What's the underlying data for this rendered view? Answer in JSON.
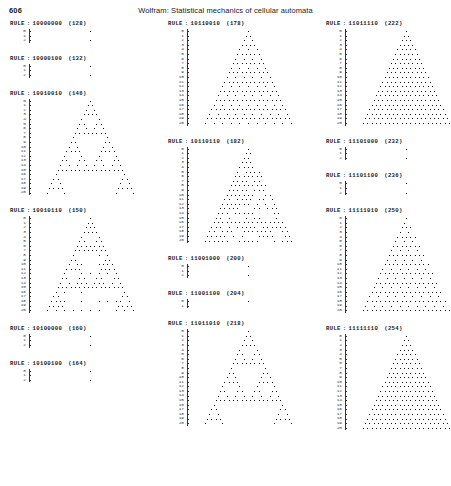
{
  "header": {
    "folio": "606",
    "running_head": "Wolfram:  Statistical mechanics of cellular automata"
  },
  "axis": {
    "row_labels": [
      "0",
      "1",
      "2",
      "3",
      "4",
      "5",
      "6",
      "7",
      "8",
      "9",
      "10",
      "11",
      "12",
      "13",
      "14",
      "15",
      "16",
      "17",
      "18",
      "19",
      "20"
    ],
    "rows": 21
  },
  "label_parts": {
    "prefix": "RULE",
    "separator": ":"
  },
  "columns": [
    {
      "blocks": [
        {
          "rule_binary": "10000000",
          "rule_decimal": "(128)",
          "pattern": "blank-single",
          "rows_shown": 3,
          "height": 18
        },
        {
          "rule_binary": "10000100",
          "rule_decimal": "(132)",
          "pattern": "blank-single",
          "rows_shown": 3,
          "height": 18
        },
        {
          "rule_binary": "10010010",
          "rule_decimal": "(146)",
          "pattern": "sierpinski-sparse",
          "rows_shown": 21,
          "height": 98
        },
        {
          "rule_binary": "10010110",
          "rule_decimal": "(150)",
          "pattern": "sierpinski-nested",
          "rows_shown": 21,
          "height": 98
        },
        {
          "rule_binary": "10100000",
          "rule_decimal": "(160)",
          "pattern": "blank-single",
          "rows_shown": 3,
          "height": 18
        },
        {
          "rule_binary": "10100100",
          "rule_decimal": "(164)",
          "pattern": "blank-single",
          "rows_shown": 3,
          "height": 18
        }
      ]
    },
    {
      "blocks": [
        {
          "rule_binary": "10110010",
          "rule_decimal": "(178)",
          "pattern": "checker-triangle",
          "rows_shown": 21,
          "height": 98
        },
        {
          "rule_binary": "10110110",
          "rule_decimal": "(182)",
          "pattern": "dense-noise-triangle",
          "rows_shown": 21,
          "height": 98
        },
        {
          "rule_binary": "11001000",
          "rule_decimal": "(200)",
          "pattern": "blank-single",
          "rows_shown": 3,
          "height": 18
        },
        {
          "rule_binary": "11001100",
          "rule_decimal": "(204)",
          "pattern": "blank-single",
          "rows_shown": 2,
          "height": 14
        },
        {
          "rule_binary": "11011010",
          "rule_decimal": "(218)",
          "pattern": "sierpinski-sparse",
          "rows_shown": 21,
          "height": 98
        }
      ]
    },
    {
      "blocks": [
        {
          "rule_binary": "11011110",
          "rule_decimal": "(222)",
          "pattern": "solid-triangle",
          "rows_shown": 21,
          "height": 98
        },
        {
          "rule_binary": "11101000",
          "rule_decimal": "(232)",
          "pattern": "blank-single",
          "rows_shown": 3,
          "height": 18
        },
        {
          "rule_binary": "11101100",
          "rule_decimal": "(236)",
          "pattern": "blank-single",
          "rows_shown": 3,
          "height": 18
        },
        {
          "rule_binary": "11111010",
          "rule_decimal": "(250)",
          "pattern": "dotted-triangle",
          "rows_shown": 21,
          "height": 98
        },
        {
          "rule_binary": "11111110",
          "rule_decimal": "(254)",
          "pattern": "solid-triangle",
          "rows_shown": 21,
          "height": 98
        }
      ]
    }
  ]
}
